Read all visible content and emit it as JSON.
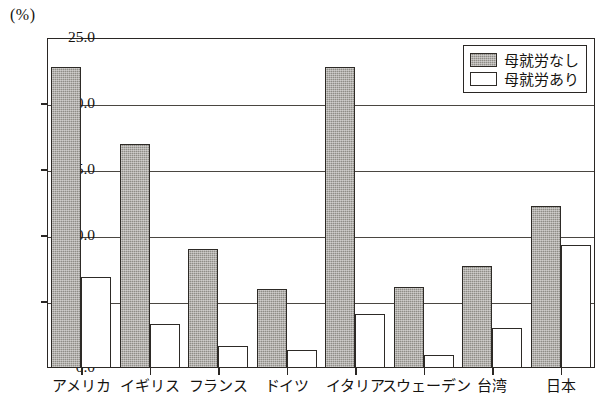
{
  "chart_data": {
    "type": "bar",
    "title": "",
    "xlabel": "",
    "ylabel": "(%)",
    "unit_label": "(%)",
    "ylim": [
      0.0,
      25.0
    ],
    "ytick_values": [
      0.0,
      5.0,
      10.0,
      15.0,
      20.0,
      25.0
    ],
    "ytick_labels": [
      "0.0",
      "5.0",
      "10.0",
      "15.0",
      "20.0",
      "25.0"
    ],
    "grid": true,
    "grid_axis": "y",
    "legend_position": "top-right",
    "categories": [
      "アメリカ",
      "イギリス",
      "フランス",
      "ドイツ",
      "イタリア",
      "スウェーデン",
      "台湾",
      "日本"
    ],
    "series": [
      {
        "name": "母就労なし",
        "color": "#8f8d87",
        "pattern": "checker-hatch",
        "values": [
          22.8,
          17.0,
          9.0,
          6.0,
          22.8,
          6.1,
          7.7,
          12.3
        ]
      },
      {
        "name": "母就労あり",
        "color": "#ffffff",
        "pattern": "solid",
        "values": [
          6.9,
          3.3,
          1.7,
          1.4,
          4.1,
          1.0,
          3.0,
          9.3
        ]
      }
    ]
  },
  "colors": {
    "axis": "#2a2724",
    "grid": "#4a4641",
    "bar_dark": "#8f8d87",
    "bar_light": "#ffffff",
    "background": "#ffffff"
  }
}
